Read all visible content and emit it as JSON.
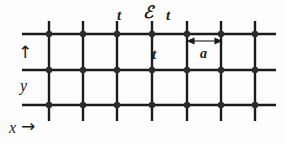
{
  "figure": {
    "caption_type": "square-lattice-tight-binding",
    "labels": {
      "hopping_left": "t",
      "hopping_right": "t",
      "hopping_vertical": "t",
      "onsite_energy": "ℰ",
      "lattice_constant": "a",
      "axis_y": "y",
      "axis_y_arrow": "↑",
      "axis_x": "x",
      "axis_x_arrow": "→"
    },
    "colors": {
      "line": "#1a1a1a",
      "node": "#2b2b2b",
      "background": "#fdfdfd",
      "text": "#1a1a1a"
    },
    "lattice": {
      "rows": 3,
      "columns": 7,
      "column_x": [
        49,
        83,
        117,
        152,
        187,
        221,
        255
      ],
      "row_y": [
        34,
        70,
        105
      ],
      "h_line_x_start": 22,
      "h_line_x_end": 276,
      "v_line_y_start": 21,
      "v_line_y_end": 121,
      "node_radius": 3.2,
      "line_width": 2.4
    },
    "measure_arrow": {
      "x_start": 188,
      "x_end": 221,
      "y": 41
    }
  }
}
